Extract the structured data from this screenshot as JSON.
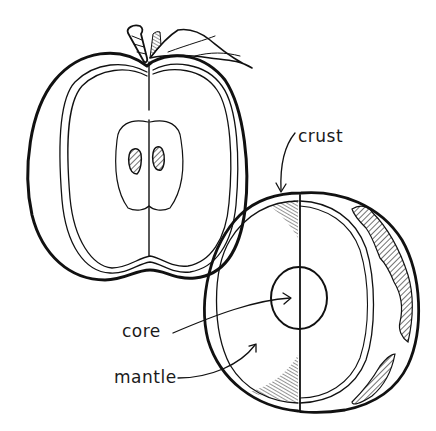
{
  "diagram": {
    "figures": [
      {
        "name": "apple-cross-section",
        "parts": [
          "stem",
          "leaf",
          "skin",
          "flesh",
          "core",
          "seeds"
        ]
      },
      {
        "name": "earth-cross-section",
        "parts": [
          "crust",
          "mantle",
          "core"
        ]
      }
    ],
    "labels": {
      "crust": "crust",
      "core": "core",
      "mantle": "mantle"
    },
    "colors": {
      "ink": "#111111",
      "background": "#ffffff"
    }
  }
}
